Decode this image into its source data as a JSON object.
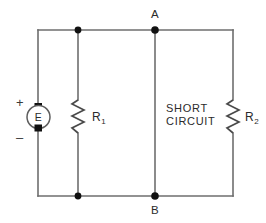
{
  "diagram": {
    "nodes": {
      "top_label": "A",
      "bottom_label": "B"
    },
    "source": {
      "label": "E",
      "plus_sign": "+",
      "minus_sign": "–"
    },
    "resistor_1": {
      "label": "R",
      "subscript": "1"
    },
    "resistor_2": {
      "label": "R",
      "subscript": "2"
    },
    "short_circuit": {
      "line1": "SHORT",
      "line2": "CIRCUIT"
    },
    "colors": {
      "wire": "#6e6e6e",
      "component": "#4a4a4a",
      "node": "#111111",
      "text": "#2b2b2b",
      "background": "#ffffff"
    }
  }
}
